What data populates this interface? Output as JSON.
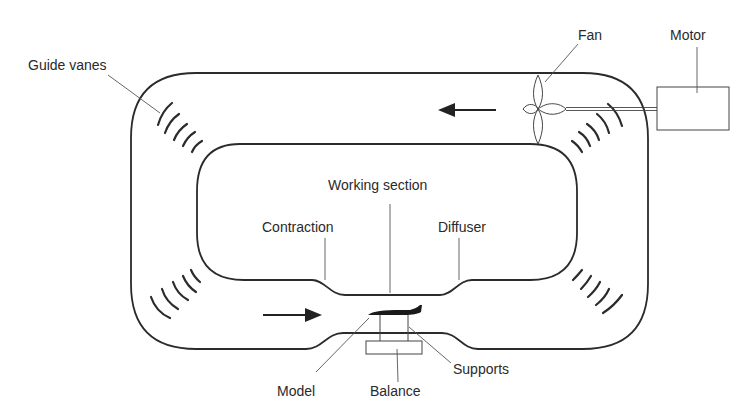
{
  "diagram": {
    "labels": {
      "fan": "Fan",
      "motor": "Motor",
      "guide_vanes": "Guide vanes",
      "working_section": "Working section",
      "contraction": "Contraction",
      "diffuser": "Diffuser",
      "model": "Model",
      "balance": "Balance",
      "supports": "Supports"
    },
    "flow_arrows": [
      {
        "location": "upper return leg",
        "direction": "left"
      },
      {
        "location": "lower leg before contraction",
        "direction": "right"
      }
    ],
    "colors": {
      "line": "#2b2b2b",
      "background": "#ffffff"
    }
  }
}
